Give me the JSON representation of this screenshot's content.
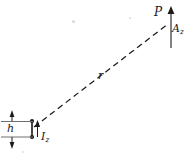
{
  "figure": {
    "kind": "physics-diagram",
    "background_color": "#ffffff",
    "ink_color": "#1b1b1b",
    "width": 191,
    "height": 158,
    "labels": {
      "observation_point": "P",
      "vector_potential": "A",
      "vector_potential_subscript": "z",
      "distance": "r",
      "dipole_length": "h",
      "current": "I",
      "current_subscript": "z"
    },
    "geometry": {
      "dipole_x": 32,
      "dipole_top_y": 121,
      "dipole_bottom_y": 137,
      "observation_point_x": 171,
      "observation_point_y": 21,
      "ray_dash_pattern": "6 4",
      "extension_line_left_x": 1,
      "extension_line_right_x": 33,
      "extension_line_top_y": 121,
      "extension_line_bottom_y": 137,
      "dimension_arrow_x": 12,
      "current_arrow_x": 37,
      "potential_arrow_x": 171,
      "potential_arrow_top_y": 8,
      "potential_arrow_bottom_y": 48
    }
  }
}
